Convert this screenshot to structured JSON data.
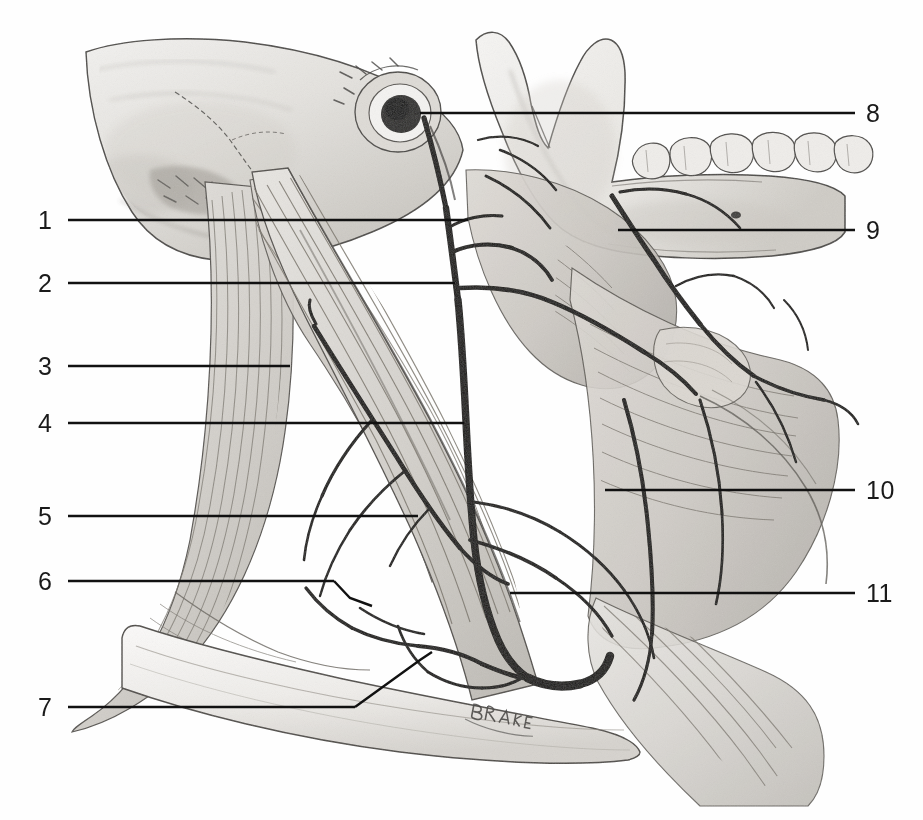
{
  "figure": {
    "artist_signature": "BLAKE",
    "background_color": "#fefefe",
    "ink_color": "#1a1a1a",
    "leader_line_color": "#111111"
  },
  "labels": {
    "left": [
      {
        "id": "1",
        "text": "1",
        "num_x": 38,
        "num_y": 208,
        "line_y": 220,
        "line_x1": 68,
        "line_x2": 468
      },
      {
        "id": "2",
        "text": "2",
        "num_x": 38,
        "num_y": 271,
        "line_y": 283,
        "line_x1": 68,
        "line_x2": 455
      },
      {
        "id": "3",
        "text": "3",
        "num_x": 38,
        "num_y": 354,
        "line_y": 366,
        "line_x1": 68,
        "line_x2": 290
      },
      {
        "id": "4",
        "text": "4",
        "num_x": 38,
        "num_y": 411,
        "line_y": 423,
        "line_x1": 68,
        "line_x2": 464
      },
      {
        "id": "5",
        "text": "5",
        "num_x": 38,
        "num_y": 504,
        "line_y": 516,
        "line_x1": 68,
        "line_x2": 418
      },
      {
        "id": "6",
        "text": "6",
        "num_x": 38,
        "num_y": 569,
        "line_y": 581,
        "line_x1": 68,
        "line_x2": 334
      },
      {
        "id": "7",
        "text": "7",
        "num_x": 38,
        "num_y": 695,
        "line_y": 707,
        "line_x1": 68,
        "line_x2": 355
      }
    ],
    "right": [
      {
        "id": "8",
        "text": "8",
        "num_x": 866,
        "num_y": 101,
        "line_y": 113,
        "line_x1": 420,
        "line_x2": 855
      },
      {
        "id": "9",
        "text": "9",
        "num_x": 866,
        "num_y": 218,
        "line_y": 230,
        "line_x1": 618,
        "line_x2": 855
      },
      {
        "id": "10",
        "text": "10",
        "num_x": 866,
        "num_y": 478,
        "line_y": 490,
        "line_x1": 605,
        "line_x2": 855
      },
      {
        "id": "11",
        "text": "11",
        "num_x": 866,
        "num_y": 581,
        "line_y": 593,
        "line_x1": 510,
        "line_x2": 855
      }
    ],
    "elbow_lines": [
      {
        "id": "6-elbow",
        "points": "334,581 350,598 372,606"
      },
      {
        "id": "7-elbow",
        "points": "355,707 420,660 432,652"
      }
    ]
  },
  "anatomy": {
    "structures": [
      "occipital bone",
      "mastoid process",
      "external acoustic meatus",
      "mandibular condyle",
      "coronoid process",
      "mandibular ramus",
      "mandibular body with teeth",
      "sternocleidomastoid muscle",
      "trapezius muscle",
      "splenius capitis muscle",
      "clavicle",
      "external jugular vein",
      "retromandibular vein",
      "facial vein",
      "posterior auricular vein",
      "anterior jugular vein",
      "occipital vein",
      "submandibular gland",
      "omohyoid muscle"
    ]
  }
}
